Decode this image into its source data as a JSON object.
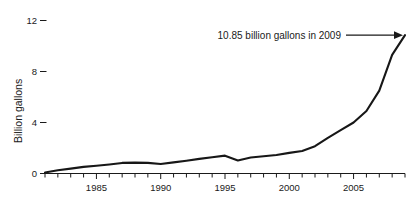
{
  "chart_data": {
    "type": "line",
    "title": "",
    "subtitle": "",
    "xlabel": "",
    "ylabel": "Billion gallons",
    "xlim": [
      1981,
      2009
    ],
    "ylim": [
      0,
      12.8
    ],
    "grid": false,
    "legend": "none",
    "x_tick_labels": [
      "1985",
      "1990",
      "1995",
      "2000",
      "2005"
    ],
    "x_tick_values": [
      1985,
      1990,
      1995,
      2000,
      2005
    ],
    "x_minor_tick_values": [
      1981,
      1982,
      1983,
      1984,
      1985,
      1986,
      1987,
      1988,
      1989,
      1990,
      1991,
      1992,
      1993,
      1994,
      1995,
      1996,
      1997,
      1998,
      1999,
      2000,
      2001,
      2002,
      2003,
      2004,
      2005,
      2006,
      2007,
      2008,
      2009
    ],
    "y_tick_labels": [
      "0",
      "4",
      "8",
      "12"
    ],
    "y_tick_values": [
      0,
      4,
      8,
      12
    ],
    "x": [
      1981,
      1982,
      1983,
      1984,
      1985,
      1986,
      1987,
      1988,
      1989,
      1990,
      1991,
      1992,
      1993,
      1994,
      1995,
      1996,
      1997,
      1998,
      1999,
      2000,
      2001,
      2002,
      2003,
      2004,
      2005,
      2006,
      2007,
      2008,
      2009
    ],
    "values": [
      0.08,
      0.25,
      0.38,
      0.52,
      0.61,
      0.71,
      0.83,
      0.85,
      0.83,
      0.75,
      0.87,
      1.0,
      1.15,
      1.28,
      1.4,
      1.02,
      1.25,
      1.35,
      1.45,
      1.62,
      1.77,
      2.14,
      2.8,
      3.4,
      4.0,
      4.9,
      6.5,
      9.3,
      10.85
    ],
    "series": [
      {
        "name": "Ethanol production",
        "color": "#171717",
        "values": [
          0.08,
          0.25,
          0.38,
          0.52,
          0.61,
          0.71,
          0.83,
          0.85,
          0.83,
          0.75,
          0.87,
          1.0,
          1.15,
          1.28,
          1.4,
          1.02,
          1.25,
          1.35,
          1.45,
          1.62,
          1.77,
          2.14,
          2.8,
          3.4,
          4.0,
          4.9,
          6.5,
          9.3,
          10.85
        ]
      }
    ],
    "annotations": [
      {
        "text": "10.85 billion gallons in 2009",
        "points_to_x": 2009,
        "points_to_y": 10.85,
        "arrow": "arrow-right"
      }
    ]
  },
  "axes": {
    "y_title": "Billion gallons"
  },
  "colors": {
    "line": "#171717",
    "axis": "#1a1a1a",
    "background": "#ffffff",
    "text": "#1a1a1a"
  }
}
